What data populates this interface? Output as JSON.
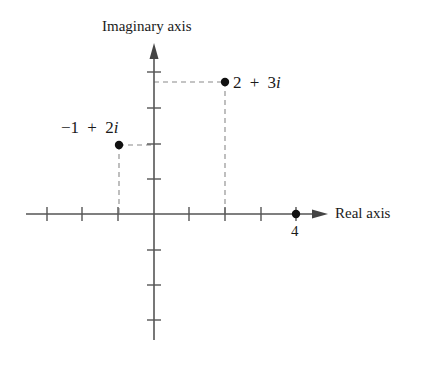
{
  "diagram": {
    "axes": {
      "horizontal": {
        "label": "Real axis",
        "range": [
          -3,
          4
        ],
        "ticks": [
          -3,
          -2,
          -1,
          1,
          2,
          3,
          4
        ],
        "labeled_ticks": [
          {
            "value": 4,
            "text": "4"
          }
        ]
      },
      "vertical": {
        "label": "Imaginary axis",
        "range": [
          -3,
          4
        ],
        "ticks": [
          -3,
          -2,
          -1,
          1,
          2,
          3,
          4
        ]
      }
    },
    "points": [
      {
        "id": "p1",
        "re": -1,
        "im": 2,
        "label": "−1 + 2",
        "label_imag_unit": "i",
        "dashed_guides": true
      },
      {
        "id": "p2",
        "re": 2,
        "im": 3,
        "label": "2 + 3",
        "label_imag_unit": "i",
        "dashed_guides": true
      },
      {
        "id": "p3",
        "re": 4,
        "im": 0,
        "label": "4",
        "dashed_guides": false
      }
    ],
    "colors": {
      "axis": "#555555",
      "point": "#111111",
      "dashed": "#888888",
      "text": "#1a1a1a",
      "background": "#ffffff"
    }
  }
}
